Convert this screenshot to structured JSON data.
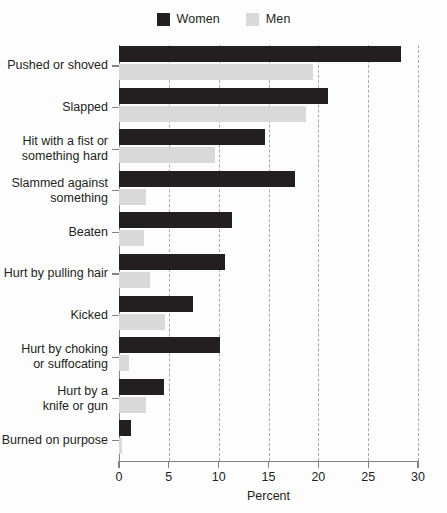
{
  "chart_data": {
    "type": "bar",
    "orientation": "horizontal",
    "title": "",
    "xlabel": "Percent",
    "ylabel": "",
    "xlim": [
      0,
      30
    ],
    "xticks": [
      0,
      5,
      10,
      15,
      20,
      25,
      30
    ],
    "xticklabels": [
      "0",
      "5",
      "10",
      "15",
      "20",
      "25",
      "30"
    ],
    "grid": "vertical-dashed",
    "legend_position": "top-center",
    "categories": [
      "Pushed or shoved",
      "Slapped",
      "Hit with a fist or something hard",
      "Slammed against something",
      "Beaten",
      "Hurt by pulling hair",
      "Kicked",
      "Hurt by choking or suffocating",
      "Hurt by a knife or gun",
      "Burned on purpose"
    ],
    "category_lines": [
      [
        "Pushed or shoved"
      ],
      [
        "Slapped"
      ],
      [
        "Hit with a fist or",
        "something hard"
      ],
      [
        "Slammed against",
        "something"
      ],
      [
        "Beaten"
      ],
      [
        "Hurt by pulling hair"
      ],
      [
        "Kicked"
      ],
      [
        "Hurt by choking",
        "or suffocating"
      ],
      [
        "Hurt by a",
        "knife or gun"
      ],
      [
        "Burned on purpose"
      ]
    ],
    "series": [
      {
        "name": "Women",
        "color": "#231f20",
        "values": [
          28.3,
          21.0,
          14.6,
          17.7,
          11.3,
          10.6,
          7.4,
          10.1,
          4.5,
          1.2
        ]
      },
      {
        "name": "Men",
        "color": "#d9d9d9",
        "values": [
          19.5,
          18.8,
          9.6,
          2.7,
          2.5,
          3.1,
          4.6,
          1.0,
          2.7,
          0.3
        ]
      }
    ]
  },
  "legend": {
    "items": [
      {
        "label": "Women",
        "swatch": "women"
      },
      {
        "label": "Men",
        "swatch": "men"
      }
    ]
  },
  "axis": {
    "x_title": "Percent"
  }
}
